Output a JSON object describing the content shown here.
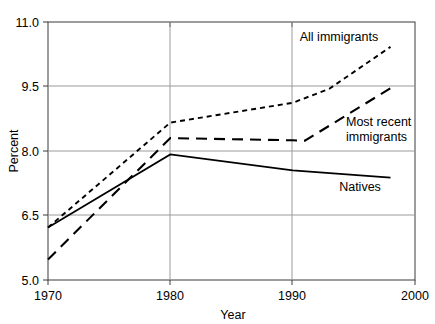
{
  "chart_data": {
    "type": "line",
    "title": "",
    "xlabel": "Year",
    "ylabel": "Percent",
    "xlim": [
      1970,
      2000
    ],
    "ylim": [
      5.0,
      11.0
    ],
    "xticks": [
      "1970",
      "1980",
      "1990",
      "2000"
    ],
    "xtick_values": [
      1970,
      1980,
      1990,
      2000
    ],
    "yticks": [
      "5.0",
      "6.5",
      "8.0",
      "9.5",
      "11.0"
    ],
    "ytick_values": [
      5.0,
      6.5,
      8.0,
      9.5,
      11.0
    ],
    "grid": "horizontal",
    "legend_position": "inline-annotations",
    "series": [
      {
        "name": "All immigrants",
        "style": "dotted",
        "x": [
          1970,
          1980,
          1990,
          1993,
          1998
        ],
        "values": [
          6.22,
          8.66,
          9.12,
          9.45,
          10.42
        ]
      },
      {
        "name": "Most recent immigrants",
        "style": "dashed",
        "x": [
          1970,
          1980,
          1990,
          1991,
          1998
        ],
        "values": [
          5.48,
          8.3,
          8.25,
          8.24,
          9.46
        ]
      },
      {
        "name": "Natives",
        "style": "solid",
        "x": [
          1970,
          1980,
          1990,
          1998
        ],
        "values": [
          6.22,
          7.92,
          7.55,
          7.38
        ]
      }
    ],
    "annotations": [
      {
        "text": "All immigrants",
        "x": 1993,
        "y": 10.45
      },
      {
        "text": "Most recent",
        "x": 1994,
        "y": 8.78
      },
      {
        "text": "immigrants",
        "x": 1994,
        "y": 8.45
      },
      {
        "text": "Natives",
        "x": 1994,
        "y": 7.05
      }
    ]
  },
  "labels": {
    "ylabel": "Percent",
    "xlabel": "Year",
    "series_all_immigrants": "All immigrants",
    "series_most_recent_line1": "Most recent",
    "series_most_recent_line2": "immigrants",
    "series_natives": "Natives",
    "ytick_0": "11.0",
    "ytick_1": "9.5",
    "ytick_2": "8.0",
    "ytick_3": "6.5",
    "ytick_4": "5.0",
    "xtick_0": "1970",
    "xtick_1": "1980",
    "xtick_2": "1990",
    "xtick_3": "2000"
  }
}
